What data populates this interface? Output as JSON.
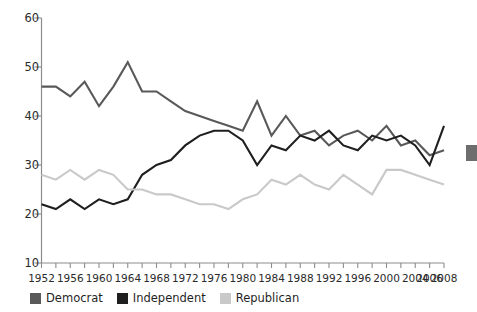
{
  "chart_data": {
    "type": "line",
    "title": "",
    "xlabel": "",
    "ylabel": "",
    "xlim": [
      1952,
      2008
    ],
    "ylim": [
      10,
      60
    ],
    "grid": false,
    "legend_position": "bottom-left",
    "x": [
      1952,
      1954,
      1956,
      1958,
      1960,
      1962,
      1964,
      1966,
      1968,
      1970,
      1972,
      1974,
      1976,
      1978,
      1980,
      1982,
      1984,
      1986,
      1988,
      1990,
      1992,
      1994,
      1996,
      1998,
      2000,
      2002,
      2004,
      2006,
      2008
    ],
    "xtick_labels": [
      "1952",
      "1956",
      "1960",
      "1964",
      "1968",
      "1972",
      "1976",
      "1980",
      "1984",
      "1988",
      "1992",
      "1996",
      "2000",
      "2004",
      "2006",
      "2008"
    ],
    "xtick_values": [
      1952,
      1956,
      1960,
      1964,
      1968,
      1972,
      1976,
      1980,
      1984,
      1988,
      1992,
      1996,
      2000,
      2004,
      2006,
      2008
    ],
    "ytick_labels": [
      "10",
      "20",
      "30",
      "40",
      "50",
      "60"
    ],
    "ytick_values": [
      10,
      20,
      30,
      40,
      50,
      60
    ],
    "series": [
      {
        "name": "Democrat",
        "color": "#595959",
        "values": [
          46,
          46,
          44,
          47,
          42,
          46,
          51,
          45,
          45,
          43,
          41,
          40,
          39,
          38,
          37,
          43,
          36,
          40,
          36,
          37,
          34,
          36,
          37,
          35,
          38,
          34,
          35,
          32,
          33
        ]
      },
      {
        "name": "Independent",
        "color": "#1f1f1f",
        "values": [
          22,
          21,
          23,
          21,
          23,
          22,
          23,
          28,
          30,
          31,
          34,
          36,
          37,
          37,
          35,
          30,
          34,
          33,
          36,
          35,
          37,
          34,
          33,
          36,
          35,
          36,
          34,
          30,
          38
        ]
      },
      {
        "name": "Republican",
        "color": "#c9c9c9",
        "values": [
          28,
          27,
          29,
          27,
          29,
          28,
          25,
          25,
          24,
          24,
          23,
          22,
          22,
          21,
          23,
          24,
          27,
          26,
          28,
          26,
          25,
          28,
          26,
          24,
          29,
          29,
          28,
          27,
          26
        ]
      }
    ]
  },
  "legend": {
    "items": [
      {
        "label": "Democrat",
        "color": "#595959"
      },
      {
        "label": "Independent",
        "color": "#1f1f1f"
      },
      {
        "label": "Republican",
        "color": "#c9c9c9"
      }
    ]
  }
}
